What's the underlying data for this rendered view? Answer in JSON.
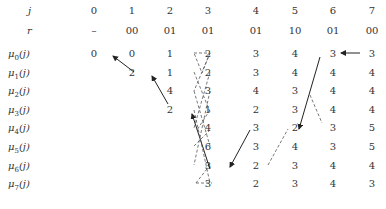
{
  "table": {
    "header_j": {
      "label": "j",
      "values": [
        "0",
        "1",
        "2",
        "3",
        "4",
        "5",
        "6",
        "7"
      ]
    },
    "header_r": {
      "label": "r",
      "values": [
        "–",
        "00",
        "01",
        "01",
        "01",
        "10",
        "01",
        "00"
      ],
      "ellipsis": "···"
    },
    "rows": [
      {
        "label_base": "μ",
        "label_sub": "0",
        "label_suffix": "(j)",
        "values": [
          "0",
          "0",
          "1",
          "2",
          "3",
          "4",
          "3",
          "3"
        ]
      },
      {
        "label_base": "μ",
        "label_sub": "1",
        "label_suffix": "(j)",
        "values": [
          "",
          "2",
          "1",
          "2",
          "3",
          "4",
          "4",
          "4"
        ]
      },
      {
        "label_base": "μ",
        "label_sub": "2",
        "label_suffix": "(j)",
        "values": [
          "",
          "",
          "4",
          "3",
          "4",
          "3",
          "4",
          "4"
        ]
      },
      {
        "label_base": "μ",
        "label_sub": "3",
        "label_suffix": "(j)",
        "values": [
          "",
          "",
          "2",
          "1",
          "2",
          "3",
          "4",
          "4"
        ]
      },
      {
        "label_base": "μ",
        "label_sub": "4",
        "label_suffix": "(j)",
        "values": [
          "",
          "",
          "",
          "4",
          "3",
          "2",
          "3",
          "5"
        ]
      },
      {
        "label_base": "μ",
        "label_sub": "5",
        "label_suffix": "(j)",
        "values": [
          "",
          "",
          "",
          "6",
          "3",
          "4",
          "3",
          "5"
        ]
      },
      {
        "label_base": "μ",
        "label_sub": "6",
        "label_suffix": "(j)",
        "values": [
          "",
          "",
          "",
          "3",
          "2",
          "3",
          "4",
          "4"
        ]
      },
      {
        "label_base": "μ",
        "label_sub": "7",
        "label_suffix": "(j)",
        "values": [
          "",
          "",
          "",
          "3",
          "2",
          "3",
          "4",
          "3"
        ]
      }
    ]
  },
  "colors": {
    "text": "#333333",
    "arrow": "#222222",
    "dashed": "#555555"
  }
}
